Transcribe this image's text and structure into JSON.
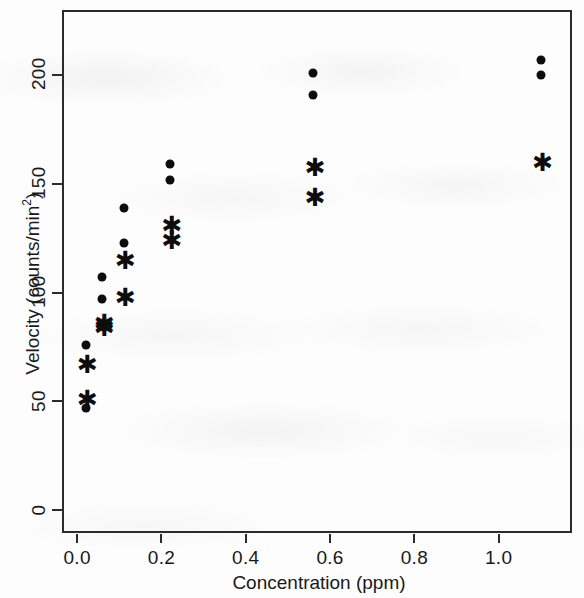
{
  "chart_data": {
    "type": "scatter",
    "title": "",
    "xlabel": "Concentration (ppm)",
    "ylabel": "Velocity (counts/min²)",
    "ylabel_text": "Velocity (counts/min",
    "ylabel_sup": "2",
    "ylabel_tail": ")",
    "xlim": [
      -0.036,
      1.174
    ],
    "ylim": [
      -10.6,
      230.0
    ],
    "grid": false,
    "legend": null,
    "xticks": [
      0.0,
      0.2,
      0.4,
      0.6,
      0.8,
      1.0
    ],
    "xticklabels": [
      "0.0",
      "0.2",
      "0.4",
      "0.6",
      "0.8",
      "1.0"
    ],
    "yticks": [
      0,
      50,
      100,
      150,
      200
    ],
    "yticklabels": [
      "0",
      "50",
      "100",
      "150",
      "200"
    ],
    "series": [
      {
        "name": "treated",
        "marker": "filled-circle",
        "color": "#0d0d0d",
        "points": [
          {
            "x": 0.02,
            "y": 76
          },
          {
            "x": 0.02,
            "y": 47
          },
          {
            "x": 0.06,
            "y": 97
          },
          {
            "x": 0.06,
            "y": 107
          },
          {
            "x": 0.11,
            "y": 123
          },
          {
            "x": 0.11,
            "y": 139
          },
          {
            "x": 0.22,
            "y": 159
          },
          {
            "x": 0.22,
            "y": 152
          },
          {
            "x": 0.56,
            "y": 191
          },
          {
            "x": 0.56,
            "y": 201
          },
          {
            "x": 1.1,
            "y": 207
          },
          {
            "x": 1.1,
            "y": 200
          }
        ]
      },
      {
        "name": "untreated",
        "marker": "asterisk",
        "color": "#0d0d0d",
        "points": [
          {
            "x": 0.02,
            "y": 67
          },
          {
            "x": 0.02,
            "y": 51
          },
          {
            "x": 0.06,
            "y": 84
          },
          {
            "x": 0.06,
            "y": 86
          },
          {
            "x": 0.11,
            "y": 98
          },
          {
            "x": 0.11,
            "y": 115
          },
          {
            "x": 0.22,
            "y": 131
          },
          {
            "x": 0.22,
            "y": 124
          },
          {
            "x": 0.56,
            "y": 144
          },
          {
            "x": 0.56,
            "y": 158
          },
          {
            "x": 1.1,
            "y": 160
          }
        ]
      }
    ]
  }
}
